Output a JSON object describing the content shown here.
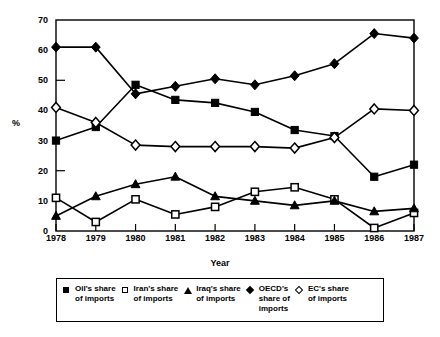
{
  "chart_data": {
    "type": "line",
    "title": "",
    "xlabel": "Year",
    "ylabel": "%",
    "categories": [
      "1978",
      "1979",
      "1980",
      "1981",
      "1982",
      "1983",
      "1984",
      "1985",
      "1986",
      "1987"
    ],
    "x": [
      1978,
      1979,
      1980,
      1981,
      1982,
      1983,
      1984,
      1985,
      1986,
      1987
    ],
    "ylim": [
      0,
      70
    ],
    "yticks": [
      0,
      10,
      20,
      30,
      40,
      50,
      60,
      70
    ],
    "grid": false,
    "legend_position": "bottom",
    "series": [
      {
        "name": "Oil's share of imports",
        "marker": "filled-square",
        "values": [
          30.0,
          34.5,
          48.5,
          43.5,
          42.5,
          39.5,
          33.5,
          31.5,
          18.0,
          22.0
        ]
      },
      {
        "name": "Iran's share of imports",
        "marker": "open-square",
        "values": [
          11.0,
          3.0,
          10.5,
          5.5,
          8.0,
          13.0,
          14.5,
          10.5,
          1.0,
          6.0
        ]
      },
      {
        "name": "Iraq's share of imports",
        "marker": "filled-triangle",
        "values": [
          5.0,
          11.5,
          15.5,
          18.0,
          11.5,
          10.0,
          8.5,
          10.0,
          6.5,
          7.5
        ]
      },
      {
        "name": "OECD's share of imports",
        "marker": "filled-diamond",
        "values": [
          61.0,
          61.0,
          45.5,
          48.0,
          50.5,
          48.5,
          51.5,
          55.5,
          65.5,
          64.0
        ]
      },
      {
        "name": "EC's share of imports",
        "marker": "open-diamond",
        "values": [
          41.0,
          36.0,
          28.5,
          28.0,
          28.0,
          28.0,
          27.5,
          31.0,
          40.5,
          40.0
        ]
      }
    ]
  },
  "legend": {
    "entries": [
      {
        "label": "Oil's share\nof imports",
        "marker": "filled-square-icon"
      },
      {
        "label": "Iran's share\nof imports",
        "marker": "open-square-icon"
      },
      {
        "label": "Iraq's share\nof imports",
        "marker": "filled-triangle-icon"
      },
      {
        "label": "OECD's\nshare of\nimports",
        "marker": "filled-diamond-icon"
      },
      {
        "label": "EC's share\nof imports",
        "marker": "open-diamond-icon"
      }
    ]
  }
}
